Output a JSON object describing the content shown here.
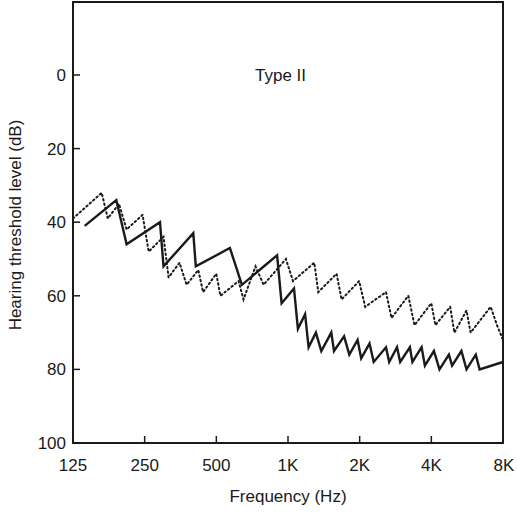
{
  "chart_data": {
    "type": "line",
    "title": "",
    "annotation": "Type II",
    "xlabel": "Frequency (Hz)",
    "ylabel": "Hearing threshold level (dB)",
    "x_scale": "log2",
    "x_ticks": [
      "125",
      "250",
      "500",
      "1K",
      "2K",
      "4K",
      "8K"
    ],
    "x_tick_values": [
      125,
      250,
      500,
      1000,
      2000,
      4000,
      8000
    ],
    "y_ticks": [
      "0",
      "20",
      "40",
      "60",
      "80",
      "100"
    ],
    "y_tick_values": [
      0,
      20,
      40,
      60,
      80,
      100
    ],
    "ylim": [
      100,
      -20
    ],
    "y_inverted": true,
    "grid": false,
    "legend": null,
    "series": [
      {
        "name": "solid",
        "style": "solid",
        "color": "#1a1a1a",
        "points": [
          [
            140,
            41
          ],
          [
            190,
            34
          ],
          [
            210,
            46
          ],
          [
            290,
            40
          ],
          [
            300,
            52
          ],
          [
            400,
            43
          ],
          [
            410,
            52
          ],
          [
            570,
            47
          ],
          [
            640,
            57
          ],
          [
            900,
            49
          ],
          [
            940,
            62
          ],
          [
            1060,
            58
          ],
          [
            1100,
            69
          ],
          [
            1180,
            65
          ],
          [
            1220,
            74
          ],
          [
            1310,
            70
          ],
          [
            1380,
            75
          ],
          [
            1520,
            70
          ],
          [
            1560,
            75
          ],
          [
            1720,
            71
          ],
          [
            1810,
            76
          ],
          [
            1960,
            72
          ],
          [
            2030,
            77
          ],
          [
            2200,
            73
          ],
          [
            2290,
            78
          ],
          [
            2580,
            74
          ],
          [
            2660,
            78
          ],
          [
            2870,
            74
          ],
          [
            2960,
            78
          ],
          [
            3250,
            74
          ],
          [
            3330,
            78
          ],
          [
            3640,
            74
          ],
          [
            3760,
            79
          ],
          [
            4100,
            75
          ],
          [
            4330,
            80
          ],
          [
            4740,
            76
          ],
          [
            4890,
            79
          ],
          [
            5350,
            75
          ],
          [
            5620,
            80
          ],
          [
            6150,
            76
          ],
          [
            6380,
            80
          ],
          [
            8000,
            78
          ]
        ]
      },
      {
        "name": "dotted",
        "style": "dotted",
        "color": "#1a1a1a",
        "points": [
          [
            125,
            39
          ],
          [
            165,
            32
          ],
          [
            175,
            39
          ],
          [
            195,
            35
          ],
          [
            210,
            42
          ],
          [
            245,
            38
          ],
          [
            260,
            48
          ],
          [
            300,
            44
          ],
          [
            315,
            55
          ],
          [
            350,
            51
          ],
          [
            375,
            57
          ],
          [
            420,
            53
          ],
          [
            440,
            59
          ],
          [
            500,
            54
          ],
          [
            520,
            60
          ],
          [
            620,
            56
          ],
          [
            650,
            61
          ],
          [
            730,
            52
          ],
          [
            790,
            57
          ],
          [
            980,
            50
          ],
          [
            1050,
            56
          ],
          [
            1290,
            51
          ],
          [
            1340,
            59
          ],
          [
            1600,
            54
          ],
          [
            1680,
            61
          ],
          [
            1990,
            56
          ],
          [
            2110,
            63
          ],
          [
            2580,
            59
          ],
          [
            2720,
            66
          ],
          [
            3200,
            60
          ],
          [
            3400,
            68
          ],
          [
            4000,
            62
          ],
          [
            4160,
            68
          ],
          [
            4800,
            63
          ],
          [
            5000,
            70
          ],
          [
            5620,
            64
          ],
          [
            5850,
            70
          ],
          [
            7100,
            63
          ],
          [
            7550,
            68
          ],
          [
            8000,
            72
          ]
        ]
      }
    ]
  }
}
